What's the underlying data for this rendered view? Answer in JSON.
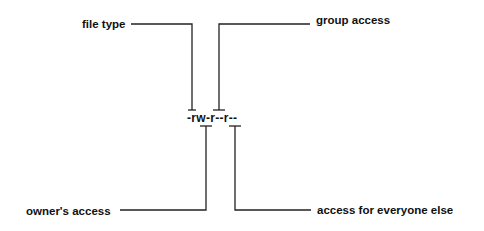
{
  "diagram": {
    "permission_string": "-rw-r--r--",
    "labels": {
      "file_type": "file type",
      "group_access": "group access",
      "owners_access": "owner's access",
      "everyone_else": "access for everyone else"
    },
    "colors": {
      "line": "#222222",
      "text": "#111111",
      "background": "#ffffff"
    }
  }
}
